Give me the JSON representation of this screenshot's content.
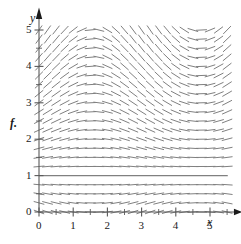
{
  "figure": {
    "part_label": "f.",
    "background": "#ffffff",
    "field_color": "#808080",
    "axis_color": "#595959",
    "equilibrium_color": "#808080"
  },
  "axes": {
    "x_axis_name": "x",
    "y_axis_name": "y",
    "x_ticks": [
      "0",
      "1",
      "2",
      "3",
      "4",
      "5"
    ],
    "y_ticks": [
      "0",
      "1",
      "2",
      "3",
      "4",
      "5"
    ],
    "x_tick_values": [
      0,
      1,
      2,
      3,
      4,
      5
    ],
    "y_tick_values": [
      0,
      1,
      2,
      3,
      4,
      5
    ],
    "x_minor_step": 0.5,
    "y_minor_step": 0.5,
    "x_arrow": true,
    "y_arrow": true
  },
  "chart_data": {
    "type": "scatter",
    "title": "",
    "xlabel": "x",
    "ylabel": "y",
    "xlim": [
      0,
      5.75
    ],
    "ylim": [
      0,
      5.25
    ],
    "grid": false,
    "legend": "none",
    "plot_kind": "slope-field",
    "equation": "dy/dx = (y - 1) cos(x)",
    "equilibrium_solutions": [
      1
    ],
    "sample_step_x": 0.25,
    "sample_step_y": 0.25,
    "x_samples": [
      0,
      0.25,
      0.5,
      0.75,
      1,
      1.25,
      1.5,
      1.75,
      2,
      2.25,
      2.5,
      2.75,
      3,
      3.25,
      3.5,
      3.75,
      4,
      4.25,
      4.5,
      4.75,
      5,
      5.25,
      5.5
    ],
    "y_samples": [
      0,
      0.25,
      0.5,
      0.75,
      1,
      1.25,
      1.5,
      1.75,
      2,
      2.25,
      2.5,
      2.75,
      3,
      3.25,
      3.5,
      3.75,
      4,
      4.25,
      4.5,
      4.75,
      5
    ],
    "slope_formula_note": "slope proportional to (y-1)*cos(x), clipped for display",
    "tick_half_length_px": 3,
    "segment_length_px": 11
  }
}
